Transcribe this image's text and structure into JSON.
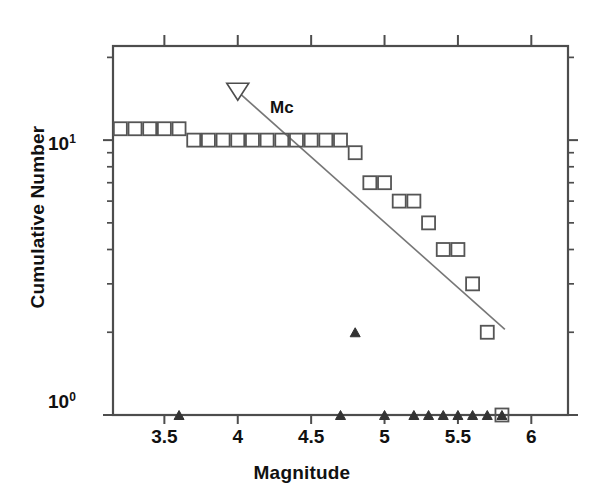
{
  "chart_data": {
    "type": "scatter",
    "title": "",
    "xlabel": "Magnitude",
    "ylabel": "Cumulative Number",
    "xlim": [
      3.15,
      6.25
    ],
    "ylim_log": [
      1,
      22
    ],
    "yscale": "log",
    "grid": false,
    "legend_position": "none",
    "xticks": [
      3.5,
      4,
      4.5,
      5,
      5.5,
      6
    ],
    "xtick_labels": [
      "3.5",
      "4",
      "4.5",
      "5",
      "5.5",
      "6"
    ],
    "ytick_labels": [
      "10⁰",
      "10¹"
    ],
    "ytick_values": [
      1,
      10
    ],
    "y_minor_ticks": [
      2,
      3,
      4,
      5,
      6,
      7,
      8,
      9,
      20
    ],
    "series": [
      {
        "name": "cumulative-number",
        "marker": "open-square",
        "x": [
          3.2,
          3.3,
          3.4,
          3.5,
          3.6,
          3.7,
          3.8,
          3.9,
          4.0,
          4.1,
          4.2,
          4.3,
          4.4,
          4.5,
          4.6,
          4.7,
          4.8,
          4.9,
          5.0,
          5.1,
          5.2,
          5.3,
          5.4,
          5.5,
          5.6,
          5.7
        ],
        "values": [
          11,
          11,
          11,
          11,
          11,
          10,
          10,
          10,
          10,
          10,
          10,
          10,
          10,
          10,
          10,
          10,
          9,
          7,
          7,
          6,
          6,
          5,
          4,
          4,
          3,
          2
        ]
      },
      {
        "name": "non-cumulative-number",
        "marker": "filled-triangle",
        "x": [
          3.6,
          4.7,
          4.8,
          5.0,
          5.2,
          5.3,
          5.4,
          5.5,
          5.6,
          5.7,
          5.8
        ],
        "values": [
          1,
          1,
          2,
          1,
          1,
          1,
          1,
          1,
          1,
          1,
          1
        ]
      }
    ],
    "annotations": [
      {
        "name": "mc-marker",
        "label": "Mc",
        "marker": "open-down-triangle",
        "x": 4.0,
        "y": 15
      }
    ],
    "fit_line": {
      "name": "gutenberg-richter-fit",
      "x_start": 4.0,
      "y_start": 15,
      "x_end": 5.82,
      "y_end": 2.05
    },
    "colors": {
      "axis": "#4d4d4d",
      "marker_square": "#555555",
      "marker_triangle": "#333333",
      "fit_line": "#777777",
      "text": "#111111",
      "background": "#ffffff"
    }
  },
  "axis_titles": {
    "x": "Magnitude",
    "y": "Cumulative Number"
  },
  "y_axis_labels": {
    "upper_mantissa": "10",
    "upper_exponent": "1",
    "lower_mantissa": "10",
    "lower_exponent": "0"
  }
}
